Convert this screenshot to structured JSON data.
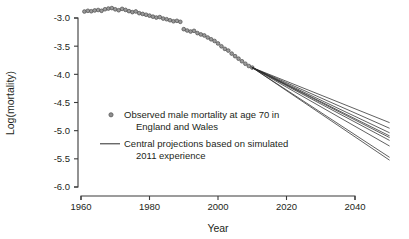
{
  "chart_data": {
    "type": "scatter",
    "title": "",
    "xlabel": "Year",
    "ylabel": "Log(mortality)",
    "xlim": [
      1958,
      2052
    ],
    "ylim": [
      -6.0,
      -2.85
    ],
    "grid": false,
    "legend_position": "inside-center-left",
    "xticks": [
      "1960",
      "1980",
      "2000",
      "2020",
      "2040"
    ],
    "xtick_values": [
      1960,
      1980,
      2000,
      2020,
      2040
    ],
    "yticks": [
      "-3.0",
      "-3.5",
      "-4.0",
      "-4.5",
      "-5.0",
      "-5.5",
      "-6.0"
    ],
    "ytick_values": [
      -3.0,
      -3.5,
      -4.0,
      -4.5,
      -5.0,
      -5.5,
      -6.0
    ],
    "legend": [
      {
        "marker": "circle",
        "color": "#9a9a9a",
        "line1": "Observed male mortality at age 70 in",
        "line2": "England and Wales"
      },
      {
        "marker": "line",
        "color": "#2b2b2b",
        "line1": "Central projections based on simulated",
        "line2": "2011 experience"
      }
    ],
    "series": [
      {
        "name": "Observed male mortality at age 70 in England and Wales",
        "type": "scatter",
        "marker": "circle",
        "color": "#9a9a9a",
        "x": [
          1961,
          1962,
          1963,
          1964,
          1965,
          1966,
          1967,
          1968,
          1969,
          1970,
          1971,
          1972,
          1973,
          1974,
          1975,
          1976,
          1977,
          1978,
          1979,
          1980,
          1981,
          1982,
          1983,
          1984,
          1985,
          1986,
          1987,
          1988,
          1989,
          1990,
          1991,
          1992,
          1993,
          1994,
          1995,
          1996,
          1997,
          1998,
          1999,
          2000,
          2001,
          2002,
          2003,
          2004,
          2005,
          2006,
          2007,
          2008,
          2009,
          2010
        ],
        "y": [
          -2.885,
          -2.872,
          -2.88,
          -2.866,
          -2.858,
          -2.872,
          -2.845,
          -2.832,
          -2.824,
          -2.846,
          -2.862,
          -2.838,
          -2.856,
          -2.878,
          -2.896,
          -2.884,
          -2.914,
          -2.928,
          -2.942,
          -2.958,
          -2.976,
          -2.992,
          -2.984,
          -3.01,
          -3.022,
          -3.04,
          -3.058,
          -3.05,
          -3.068,
          -3.198,
          -3.222,
          -3.24,
          -3.228,
          -3.268,
          -3.292,
          -3.31,
          -3.346,
          -3.378,
          -3.408,
          -3.452,
          -3.502,
          -3.548,
          -3.578,
          -3.632,
          -3.678,
          -3.722,
          -3.768,
          -3.812,
          -3.852,
          -3.88
        ]
      },
      {
        "name": "Central projection 1",
        "type": "line",
        "color": "#2b2b2b",
        "x": [
          2010,
          2050
        ],
        "y": [
          -3.88,
          -4.855
        ]
      },
      {
        "name": "Central projection 2",
        "type": "line",
        "color": "#2b2b2b",
        "x": [
          2010,
          2050
        ],
        "y": [
          -3.88,
          -4.955
        ]
      },
      {
        "name": "Central projection 3",
        "type": "line",
        "color": "#2b2b2b",
        "x": [
          2010,
          2050
        ],
        "y": [
          -3.88,
          -5.035
        ]
      },
      {
        "name": "Central projection 4",
        "type": "line",
        "color": "#2b2b2b",
        "x": [
          2010,
          2050
        ],
        "y": [
          -3.88,
          -5.09
        ]
      },
      {
        "name": "Central projection 5",
        "type": "line",
        "color": "#2b2b2b",
        "x": [
          2010,
          2050
        ],
        "y": [
          -3.88,
          -5.12
        ]
      },
      {
        "name": "Central projection 6",
        "type": "line",
        "color": "#2b2b2b",
        "x": [
          2010,
          2050
        ],
        "y": [
          -3.88,
          -5.17
        ]
      },
      {
        "name": "Central projection 7",
        "type": "line",
        "color": "#2b2b2b",
        "x": [
          2010,
          2050
        ],
        "y": [
          -3.88,
          -5.27
        ]
      },
      {
        "name": "Central projection 8",
        "type": "line",
        "color": "#2b2b2b",
        "x": [
          2010,
          2050
        ],
        "y": [
          -3.88,
          -5.47
        ]
      },
      {
        "name": "Central projection 9",
        "type": "line",
        "color": "#2b2b2b",
        "x": [
          2010,
          2050
        ],
        "y": [
          -3.88,
          -5.52
        ]
      }
    ]
  }
}
